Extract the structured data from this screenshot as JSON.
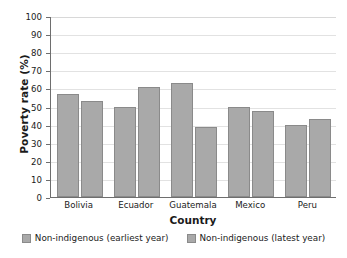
{
  "chart_data": {
    "type": "bar",
    "title": "",
    "xlabel": "Country",
    "ylabel": "Poverty rate (%)",
    "categories": [
      "Bolivia",
      "Ecuador",
      "Guatemala",
      "Mexico",
      "Peru"
    ],
    "series": [
      {
        "name": "Non-indigenous (earliest year)",
        "values": [
          57,
          50,
          63,
          49.5,
          40
        ]
      },
      {
        "name": "Non-indigenous (latest year)",
        "values": [
          53,
          61,
          38.5,
          47.5,
          43
        ]
      }
    ],
    "ylim": [
      0,
      100
    ],
    "yticks": [
      0,
      10,
      20,
      30,
      40,
      50,
      60,
      70,
      80,
      90,
      100
    ],
    "ytick_labels": [
      "0",
      "10",
      "20",
      "30",
      "40",
      "50",
      "60",
      "70",
      "80",
      "90",
      "100"
    ],
    "grid": true,
    "grid_axis": "y",
    "legend_position": "below",
    "bar_color": "#a9a9a9",
    "bar_border_color": "#8a8a8a",
    "grid_color": "#e2e2e2",
    "axis_color": "#6e6e6e",
    "background": "#ffffff"
  },
  "axis": {
    "y_title": "Poverty rate (%)",
    "x_title": "Country"
  },
  "legend": {
    "items": [
      {
        "label": "Non-indigenous (earliest year)"
      },
      {
        "label": "Non-indigenous (latest year)"
      }
    ]
  }
}
